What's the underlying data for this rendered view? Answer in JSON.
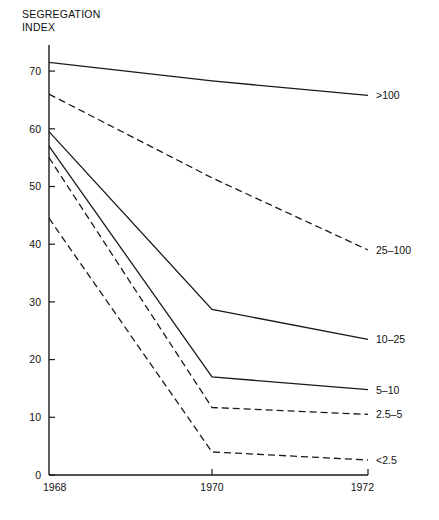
{
  "chart_data": {
    "type": "line",
    "title_line1": "SEGREGATION",
    "title_line2": "INDEX",
    "xlabel": "",
    "ylabel": "SEGREGATION INDEX",
    "x": [
      1968,
      1970,
      1972
    ],
    "xticklabels": [
      "1968",
      "1970",
      "1972"
    ],
    "yticklabels": [
      "0",
      "10",
      "20",
      "30",
      "40",
      "50",
      "60",
      "70"
    ],
    "yticks": [
      0,
      10,
      20,
      30,
      40,
      50,
      60,
      70
    ],
    "xlim": [
      1968,
      1972
    ],
    "ylim": [
      0,
      72
    ],
    "grid": false,
    "legend_position": "right-inline-labels",
    "series": [
      {
        "name": ">100",
        "label": ">100",
        "values": [
          71.5,
          68.3,
          65.8
        ],
        "style": "solid",
        "color": "#1a1a1a"
      },
      {
        "name": "25-100",
        "label": "25–100",
        "values": [
          66.0,
          51.5,
          39.0
        ],
        "style": "dashed",
        "color": "#1a1a1a"
      },
      {
        "name": "10-25",
        "label": "10–25",
        "values": [
          59.5,
          28.7,
          23.5
        ],
        "style": "solid",
        "color": "#1a1a1a"
      },
      {
        "name": "5-10",
        "label": "5–10",
        "values": [
          57.0,
          17.0,
          14.8
        ],
        "style": "solid",
        "color": "#1a1a1a"
      },
      {
        "name": "2.5-5",
        "label": "2.5–5",
        "values": [
          55.0,
          11.7,
          10.5
        ],
        "style": "dashed",
        "color": "#1a1a1a"
      },
      {
        "name": "<2.5",
        "label": "<2.5",
        "values": [
          44.5,
          4.0,
          2.6
        ],
        "style": "dashed",
        "color": "#1a1a1a"
      }
    ]
  },
  "axes": {
    "x_tick_labels": [
      "1968",
      "1970",
      "1972"
    ],
    "y_tick_labels": [
      "0",
      "10",
      "20",
      "30",
      "40",
      "50",
      "60",
      "70"
    ]
  },
  "series_labels": {
    "s0": ">100",
    "s1": "25–100",
    "s2": "10–25",
    "s3": "5–10",
    "s4": "2.5–5",
    "s5": "<2.5"
  },
  "colors": {
    "axis": "#1a1a1a",
    "line": "#1a1a1a",
    "text": "#111111",
    "background": "#ffffff"
  }
}
